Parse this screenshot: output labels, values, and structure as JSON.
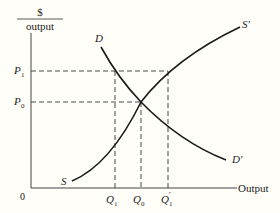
{
  "diagram": {
    "y_axis_label_numerator": "$",
    "y_axis_label_denominator": "output",
    "x_axis_label": "Output",
    "origin_label": "0",
    "price_labels": [
      {
        "main": "P",
        "sub": "1"
      },
      {
        "main": "P",
        "sub": "0"
      }
    ],
    "quantity_labels": [
      {
        "main": "Q",
        "sub": "1",
        "prime": ""
      },
      {
        "main": "Q",
        "sub": "0",
        "prime": ""
      },
      {
        "main": "Q",
        "sub": "1",
        "prime": "′"
      }
    ],
    "curves": {
      "demand": {
        "start_label": "D",
        "end_label": "D′"
      },
      "supply": {
        "start_label": "S",
        "end_label": "S′"
      }
    },
    "colors": {
      "line": "#1a1a1a",
      "background": "#fffef9"
    }
  }
}
